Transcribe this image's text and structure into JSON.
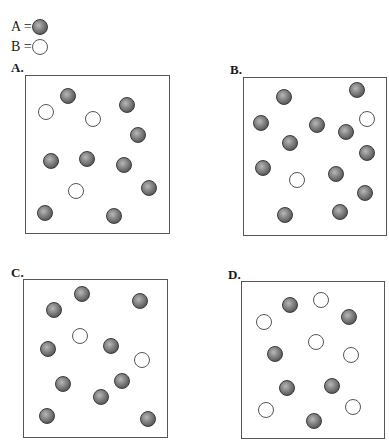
{
  "legend": [
    {
      "label": "A =",
      "type": "A",
      "description": "filled gray sphere"
    },
    {
      "label": "B =",
      "type": "B",
      "description": "empty white circle"
    }
  ],
  "panels": [
    {
      "label": "A.",
      "box": {
        "x": 25,
        "y": 75,
        "w": 145,
        "h": 159
      },
      "particles": [
        {
          "t": "A",
          "x": 68,
          "y": 96
        },
        {
          "t": "A",
          "x": 127,
          "y": 105
        },
        {
          "t": "A",
          "x": 138,
          "y": 135
        },
        {
          "t": "A",
          "x": 51,
          "y": 161
        },
        {
          "t": "A",
          "x": 87,
          "y": 159
        },
        {
          "t": "A",
          "x": 124,
          "y": 165
        },
        {
          "t": "A",
          "x": 149,
          "y": 188
        },
        {
          "t": "A",
          "x": 45,
          "y": 213
        },
        {
          "t": "A",
          "x": 114,
          "y": 216
        },
        {
          "t": "B",
          "x": 46,
          "y": 112
        },
        {
          "t": "B",
          "x": 93,
          "y": 119
        },
        {
          "t": "B",
          "x": 76,
          "y": 191
        }
      ],
      "count_A": 9,
      "count_B": 3
    },
    {
      "label": "B.",
      "box": {
        "x": 243,
        "y": 77,
        "w": 144,
        "h": 159
      },
      "particles": [
        {
          "t": "A",
          "x": 284,
          "y": 97
        },
        {
          "t": "A",
          "x": 357,
          "y": 90
        },
        {
          "t": "A",
          "x": 261,
          "y": 123
        },
        {
          "t": "A",
          "x": 317,
          "y": 125
        },
        {
          "t": "A",
          "x": 346,
          "y": 132
        },
        {
          "t": "A",
          "x": 290,
          "y": 143
        },
        {
          "t": "A",
          "x": 367,
          "y": 153
        },
        {
          "t": "A",
          "x": 263,
          "y": 168
        },
        {
          "t": "A",
          "x": 336,
          "y": 174
        },
        {
          "t": "A",
          "x": 365,
          "y": 193
        },
        {
          "t": "A",
          "x": 285,
          "y": 215
        },
        {
          "t": "A",
          "x": 340,
          "y": 212
        },
        {
          "t": "B",
          "x": 367,
          "y": 119
        },
        {
          "t": "B",
          "x": 297,
          "y": 180
        }
      ],
      "count_A": 12,
      "count_B": 2
    },
    {
      "label": "C.",
      "box": {
        "x": 23,
        "y": 279,
        "w": 145,
        "h": 159
      },
      "particles": [
        {
          "t": "A",
          "x": 82,
          "y": 294
        },
        {
          "t": "A",
          "x": 54,
          "y": 310
        },
        {
          "t": "A",
          "x": 140,
          "y": 301
        },
        {
          "t": "A",
          "x": 48,
          "y": 349
        },
        {
          "t": "A",
          "x": 111,
          "y": 346
        },
        {
          "t": "A",
          "x": 63,
          "y": 384
        },
        {
          "t": "A",
          "x": 122,
          "y": 381
        },
        {
          "t": "A",
          "x": 101,
          "y": 397
        },
        {
          "t": "A",
          "x": 47,
          "y": 416
        },
        {
          "t": "A",
          "x": 148,
          "y": 419
        },
        {
          "t": "B",
          "x": 80,
          "y": 336
        },
        {
          "t": "B",
          "x": 142,
          "y": 360
        }
      ],
      "count_A": 10,
      "count_B": 2
    },
    {
      "label": "D.",
      "box": {
        "x": 241,
        "y": 281,
        "w": 144,
        "h": 158
      },
      "particles": [
        {
          "t": "A",
          "x": 290,
          "y": 305
        },
        {
          "t": "A",
          "x": 349,
          "y": 317
        },
        {
          "t": "A",
          "x": 275,
          "y": 354
        },
        {
          "t": "A",
          "x": 287,
          "y": 388
        },
        {
          "t": "A",
          "x": 332,
          "y": 386
        },
        {
          "t": "A",
          "x": 314,
          "y": 421
        },
        {
          "t": "B",
          "x": 321,
          "y": 300
        },
        {
          "t": "B",
          "x": 264,
          "y": 322
        },
        {
          "t": "B",
          "x": 316,
          "y": 342
        },
        {
          "t": "B",
          "x": 351,
          "y": 355
        },
        {
          "t": "B",
          "x": 266,
          "y": 410
        },
        {
          "t": "B",
          "x": 353,
          "y": 407
        }
      ],
      "count_A": 6,
      "count_B": 6
    }
  ],
  "colors": {
    "sphere_light": "#b8b8b8",
    "sphere_dark": "#3e3e3e",
    "box_border": "#555555",
    "empty_fill": "#ffffff"
  }
}
